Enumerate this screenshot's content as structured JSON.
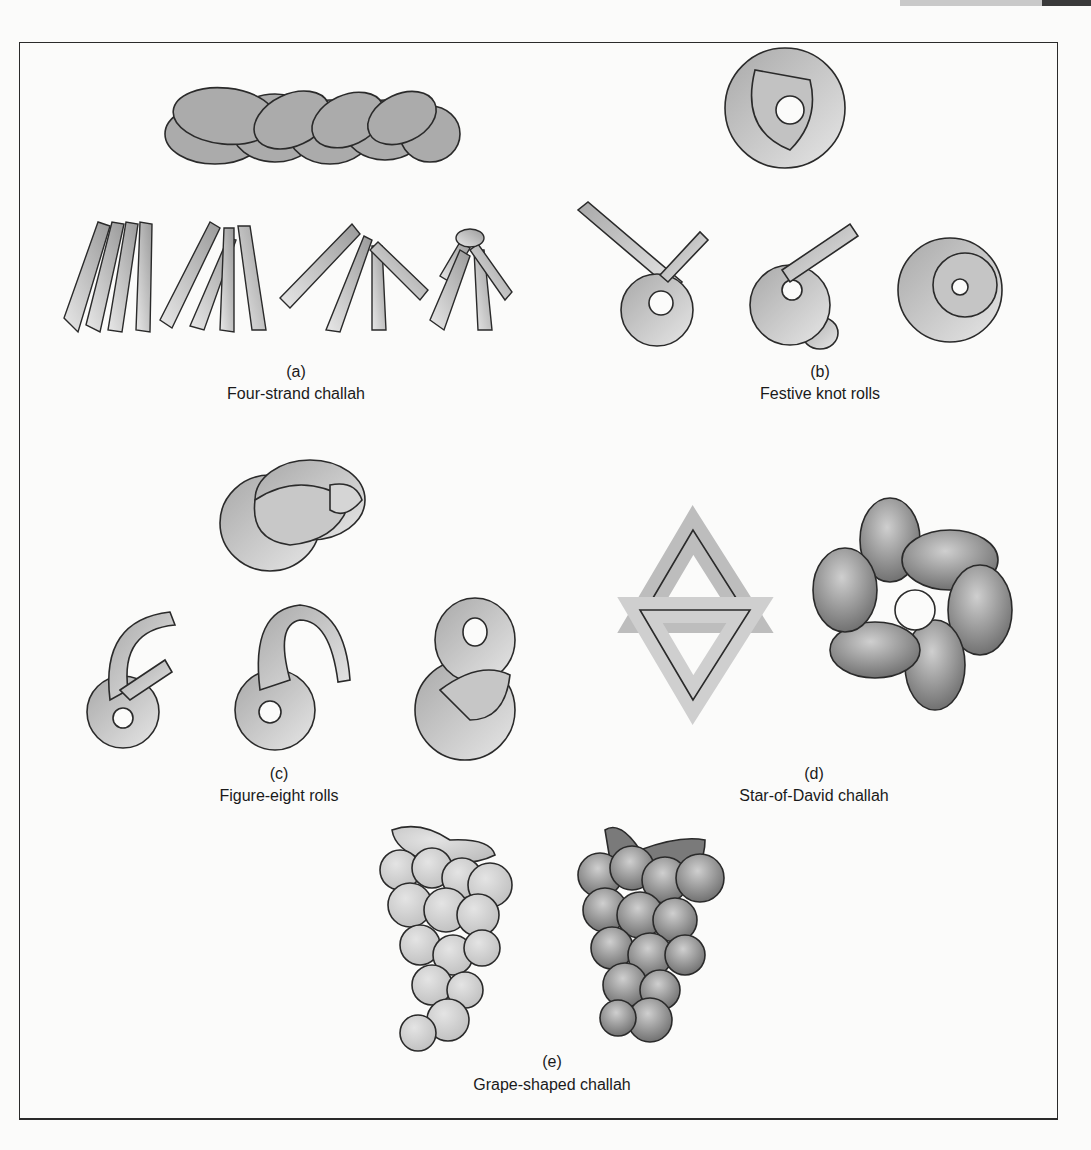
{
  "figure": {
    "panels": [
      {
        "id": "a",
        "letter": "(a)",
        "caption": "Four-strand challah"
      },
      {
        "id": "b",
        "letter": "(b)",
        "caption": "Festive knot rolls"
      },
      {
        "id": "c",
        "letter": "(c)",
        "caption": "Figure-eight rolls"
      },
      {
        "id": "d",
        "letter": "(d)",
        "caption": "Star-of-David challah"
      },
      {
        "id": "e",
        "letter": "(e)",
        "caption": "Grape-shaped challah"
      }
    ]
  },
  "colors": {
    "outline": "#2a2a2a",
    "dough_light": "#d9d9d9",
    "dough_mid": "#b4b4b4",
    "dough_dark": "#8a8a8a",
    "baked_dark": "#6e6e6e"
  }
}
